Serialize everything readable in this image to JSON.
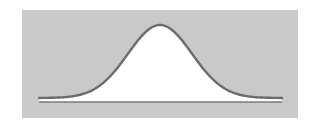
{
  "diagram": {
    "type": "normal-distribution-curve",
    "colors": {
      "page_background": "#ffffff",
      "panel_background": "#c9c9c9",
      "area_fill": "#ffffff",
      "curve_stroke": "#6b6b6b",
      "baseline_stroke": "#7a7a7a"
    },
    "panel": {
      "x": 22,
      "y": 10,
      "width": 276,
      "height": 108
    },
    "curve": {
      "x_start": 39,
      "x_end": 282,
      "peak_x": 160,
      "peak_y": 25,
      "tail_y": 98,
      "sigma_px": 32
    },
    "baseline": {
      "x1": 39,
      "x2": 282,
      "y": 102
    }
  }
}
